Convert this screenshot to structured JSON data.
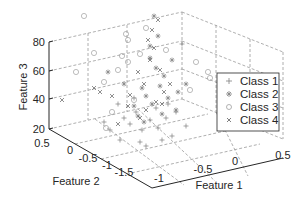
{
  "chart_data": {
    "type": "scatter3d",
    "title": "",
    "xlabel": "Feature 1",
    "ylabel": "Feature 2",
    "zlabel": "Feature 3",
    "xlim": [
      -1,
      0.5
    ],
    "ylim": [
      -1.5,
      0.5
    ],
    "zlim": [
      20,
      80
    ],
    "xticks": [
      "-1",
      "-0.5",
      "0",
      "0.5"
    ],
    "yticks": [
      "0.5",
      "0",
      "-0.5",
      "-1",
      "-1.5"
    ],
    "zticks": [
      "20",
      "40",
      "60",
      "80"
    ],
    "grid": true,
    "legend_position": "right",
    "legend": [
      "Class 1",
      "Class 2",
      "Class 3",
      "Class 4"
    ],
    "series": [
      {
        "name": "Class 1",
        "marker": "+",
        "color": "#808080",
        "points_px": [
          [
            124,
            118
          ],
          [
            130,
            124
          ],
          [
            136,
            112
          ],
          [
            142,
            130
          ],
          [
            150,
            120
          ],
          [
            158,
            128
          ],
          [
            166,
            118
          ],
          [
            172,
            136
          ],
          [
            110,
            130
          ],
          [
            120,
            140
          ],
          [
            146,
            146
          ],
          [
            156,
            108
          ],
          [
            176,
            112
          ],
          [
            186,
            126
          ],
          [
            134,
            98
          ],
          [
            162,
            140
          ],
          [
            118,
            104
          ],
          [
            104,
            122
          ],
          [
            168,
            104
          ],
          [
            182,
            44
          ],
          [
            140,
            142
          ]
        ]
      },
      {
        "name": "Class 2",
        "marker": "*",
        "color": "#808080",
        "points_px": [
          [
            108,
            72
          ],
          [
            150,
            58
          ],
          [
            156,
            68
          ],
          [
            142,
            88
          ],
          [
            146,
            96
          ],
          [
            160,
            86
          ],
          [
            164,
            76
          ],
          [
            172,
            60
          ],
          [
            124,
            84
          ],
          [
            168,
            98
          ],
          [
            178,
            92
          ],
          [
            152,
            104
          ],
          [
            138,
            116
          ],
          [
            144,
            122
          ],
          [
            134,
            106
          ],
          [
            162,
            114
          ],
          [
            154,
            16
          ],
          [
            158,
            36
          ],
          [
            150,
            46
          ],
          [
            176,
            110
          ],
          [
            186,
            84
          ]
        ]
      },
      {
        "name": "Class 3",
        "marker": "o",
        "color": "#a0a0a0",
        "points_px": [
          [
            84,
            16
          ],
          [
            76,
            72
          ],
          [
            94,
            53
          ],
          [
            104,
            82
          ],
          [
            118,
            70
          ],
          [
            126,
            34
          ],
          [
            128,
            40
          ],
          [
            128,
            62
          ],
          [
            146,
            28
          ],
          [
            196,
            62
          ],
          [
            208,
            72
          ],
          [
            210,
            78
          ],
          [
            190,
            90
          ],
          [
            134,
            100
          ],
          [
            106,
            128
          ],
          [
            112,
            112
          ],
          [
            122,
            56
          ],
          [
            166,
            50
          ],
          [
            140,
            54
          ]
        ]
      },
      {
        "name": "Class 4",
        "marker": "x",
        "color": "#606060",
        "points_px": [
          [
            94,
            88
          ],
          [
            100,
            92
          ],
          [
            130,
            95
          ],
          [
            138,
            72
          ],
          [
            144,
            84
          ],
          [
            150,
            60
          ],
          [
            154,
            48
          ],
          [
            148,
            40
          ],
          [
            160,
            70
          ],
          [
            164,
            92
          ],
          [
            170,
            84
          ],
          [
            152,
            30
          ],
          [
            158,
            20
          ],
          [
            156,
            102
          ],
          [
            140,
            118
          ],
          [
            128,
            106
          ],
          [
            146,
            110
          ],
          [
            162,
            104
          ],
          [
            118,
            124
          ],
          [
            112,
            96
          ],
          [
            62,
            100
          ]
        ]
      }
    ]
  },
  "legend": {
    "items": [
      {
        "label": "Class 1",
        "marker": "+"
      },
      {
        "label": "Class 2",
        "marker": "*"
      },
      {
        "label": "Class 3",
        "marker": "o"
      },
      {
        "label": "Class 4",
        "marker": "x"
      }
    ]
  },
  "axes": {
    "zlabel": "Feature 3",
    "ylabel": "Feature 2",
    "xlabel": "Feature 1",
    "zticks": [
      "80",
      "60",
      "40",
      "20"
    ],
    "yticks": [
      "0.5",
      "0",
      "-0.5",
      "-1",
      "-1.5"
    ],
    "xticks": [
      "-1",
      "-0.5",
      "0",
      "0.5"
    ]
  },
  "colors": {
    "axis": "#262626",
    "grid": "#909090",
    "marker": "#808080",
    "legend_border": "#262626"
  }
}
